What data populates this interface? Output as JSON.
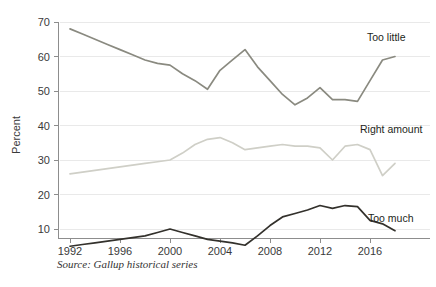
{
  "chart_data": {
    "type": "line",
    "title": "",
    "subtitle": "",
    "xlabel": "",
    "ylabel": "Percent",
    "xlim": [
      1992,
      2018
    ],
    "ylim": [
      0,
      72
    ],
    "ytick_values": [
      10,
      20,
      30,
      40,
      50,
      60,
      70
    ],
    "ytick_labels": [
      "10",
      "20",
      "30",
      "40",
      "50",
      "60",
      "70"
    ],
    "xtick_values": [
      1992,
      1996,
      2000,
      2004,
      2008,
      2012,
      2016
    ],
    "xtick_labels": [
      "1992",
      "1996",
      "2000",
      "2004",
      "2008",
      "2012",
      "2016"
    ],
    "grid": "horizontal",
    "legend_position": "inline-right",
    "source_note": "Source: Gallup historical series",
    "x": [
      1992,
      1993,
      1994,
      1995,
      1996,
      1997,
      1998,
      1999,
      2000,
      2001,
      2002,
      2003,
      2004,
      2005,
      2006,
      2007,
      2008,
      2009,
      2010,
      2011,
      2012,
      2013,
      2014,
      2015,
      2016,
      2017,
      2018
    ],
    "series": [
      {
        "name": "Too little",
        "label": "Too little",
        "color": "#8a8a80",
        "values": [
          68,
          66.5,
          65,
          63.5,
          62,
          60.5,
          59,
          58,
          57.5,
          55,
          53,
          50.5,
          56,
          59,
          62,
          57,
          53,
          49,
          46,
          48,
          51,
          47.5,
          47.5,
          47,
          53,
          59,
          60
        ]
      },
      {
        "name": "Right amount",
        "label": "Right amount",
        "color": "#cfcfc7",
        "values": [
          26,
          26.5,
          27,
          27.5,
          28,
          28.5,
          29,
          29.5,
          30,
          32,
          34.5,
          36,
          36.5,
          35,
          33,
          33.5,
          34,
          34.5,
          34,
          34,
          33.5,
          30,
          34,
          34.5,
          33,
          25.5,
          29
        ]
      },
      {
        "name": "Too much",
        "label": "Too much",
        "color": "#33312c",
        "values": [
          5,
          5.5,
          6,
          6.5,
          7,
          7.5,
          8,
          9,
          10,
          9,
          8,
          7,
          6.5,
          6,
          5.3,
          8,
          11,
          13.5,
          14.5,
          15.5,
          16.8,
          16,
          16.8,
          16.5,
          12.5,
          11.5,
          9.5
        ]
      }
    ]
  },
  "labels": {
    "too_little": "Too little",
    "right_amount": "Right amount",
    "too_much": "Too much"
  }
}
